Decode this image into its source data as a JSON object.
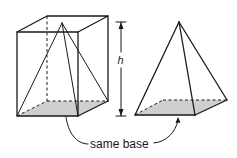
{
  "diagram": {
    "labels": {
      "height": "h",
      "base_caption": "same base"
    },
    "colors": {
      "stroke": "#1a1a1a",
      "base_fill": "#cfcfcf"
    }
  }
}
